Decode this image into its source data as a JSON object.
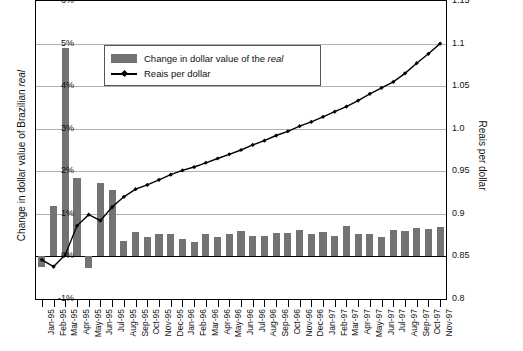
{
  "chart_data": {
    "type": "bar",
    "title": "",
    "subtitle": "",
    "ylabel": "Change in dollar value of Brazilian real",
    "y2label": "Reais per dollar",
    "xlabel": "",
    "ylim": [
      -1,
      6
    ],
    "y2lim": [
      0.8,
      1.15
    ],
    "ytick_labels": [
      "6%",
      "5%",
      "4%",
      "3%",
      "2%",
      "1%",
      "0%",
      "-1%"
    ],
    "ytick_values": [
      6,
      5,
      4,
      3,
      2,
      1,
      0,
      -1
    ],
    "y2tick_labels": [
      "1.15",
      "1.1",
      "1.05",
      "1.0",
      "0.95",
      "0.9",
      "0.85",
      "0.8"
    ],
    "y2tick_values": [
      1.15,
      1.1,
      1.05,
      1.0,
      0.95,
      0.9,
      0.85,
      0.8
    ],
    "grid": true,
    "legend_position": "upper-left-inside",
    "categories": [
      "Jan-95",
      "Feb-95",
      "Mar-95",
      "Apr-95",
      "May-95",
      "Jun-95",
      "Jul-95",
      "Aug-95",
      "Sep-95",
      "Oct-95",
      "Nov-95",
      "Dec-95",
      "Jan-96",
      "Feb-96",
      "Mar-96",
      "Apr-96",
      "May-96",
      "Jun-96",
      "Jul-96",
      "Aug-96",
      "Sep-96",
      "Oct-96",
      "Nov-96",
      "Dec-96",
      "Jan-97",
      "Feb-97",
      "Mar-97",
      "Apr-97",
      "May-97",
      "Jun-97",
      "Jul-97",
      "Aug-97",
      "Sep-97",
      "Oct-97",
      "Nov-97"
    ],
    "series": [
      {
        "name": "Change in dollar value of the real",
        "type": "bar",
        "axis": "left",
        "unit": "%",
        "color": "#737373",
        "values": [
          -0.25,
          1.18,
          4.9,
          1.85,
          -0.28,
          1.72,
          1.57,
          0.37,
          0.58,
          0.46,
          0.52,
          0.52,
          0.42,
          0.33,
          0.53,
          0.46,
          0.53,
          0.59,
          0.49,
          0.47,
          0.54,
          0.56,
          0.63,
          0.52,
          0.58,
          0.47,
          0.72,
          0.52,
          0.52,
          0.46,
          0.63,
          0.6,
          0.67,
          0.65,
          0.68
        ]
      },
      {
        "name": "Reais per dollar",
        "type": "line",
        "axis": "right",
        "unit": "reais",
        "color": "#000000",
        "marker": "diamond",
        "values": [
          0.846,
          0.838,
          0.852,
          0.886,
          0.899,
          0.892,
          0.908,
          0.92,
          0.929,
          0.934,
          0.94,
          0.946,
          0.951,
          0.955,
          0.96,
          0.965,
          0.97,
          0.975,
          0.981,
          0.986,
          0.992,
          0.997,
          1.003,
          1.008,
          1.014,
          1.02,
          1.026,
          1.033,
          1.041,
          1.048,
          1.055,
          1.065,
          1.077,
          1.088,
          1.1
        ]
      }
    ]
  },
  "legend": {
    "items": [
      {
        "label_pre": "Change in dollar value of the ",
        "label_em": "real",
        "type": "bar"
      },
      {
        "label_pre": "Reais per dollar",
        "label_em": "",
        "type": "line"
      }
    ]
  },
  "axis_titles": {
    "left_pre": "Change in dollar value of Brazilian ",
    "left_em": "real",
    "right": "Reais per dollar"
  }
}
